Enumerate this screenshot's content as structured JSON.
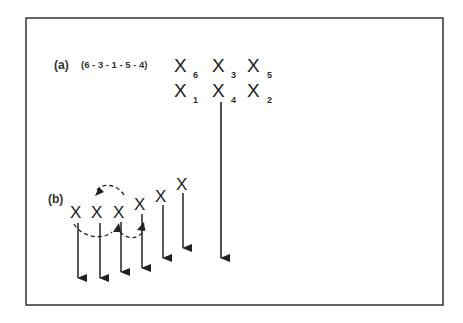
{
  "panel_a": {
    "label": "(a)",
    "sequence": "(6 - 3 - 1 - 5 - 4)",
    "grid": [
      {
        "symbol": "X",
        "sub": "6"
      },
      {
        "symbol": "X",
        "sub": "3"
      },
      {
        "symbol": "X",
        "sub": "5"
      },
      {
        "symbol": "X",
        "sub": "1"
      },
      {
        "symbol": "X",
        "sub": "4"
      },
      {
        "symbol": "X",
        "sub": "2"
      }
    ]
  },
  "panel_b": {
    "label": "(b)",
    "symbols": [
      "X",
      "X",
      "X",
      "X",
      "X",
      "X"
    ]
  },
  "colors": {
    "stroke": "#222222",
    "frame": "#333333"
  }
}
